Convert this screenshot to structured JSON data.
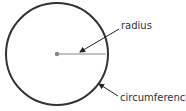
{
  "diagram": {
    "title": "",
    "labels": {
      "radius": "radius",
      "circumference": "circumference"
    },
    "colors": {
      "stroke": "#333333",
      "center": "#888888",
      "radius_line": "#888888"
    }
  }
}
